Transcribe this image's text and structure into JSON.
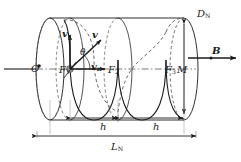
{
  "figure": {
    "background": "#ffffff",
    "line_color": "#1a1a1a",
    "dashed_color": "#4d4d4d",
    "axis_color": "#555555",
    "particle_color": "#8c8c8c"
  },
  "labels": {
    "origin": "O",
    "focus_1": {
      "base": "F",
      "sub": "1"
    },
    "focus_2": {
      "base": "F",
      "sub": "2"
    },
    "focus_3": {
      "base": "F",
      "sub": "3"
    },
    "point_m": "M",
    "diameter": {
      "base": "D",
      "sub": "N"
    },
    "field": "B",
    "velocity_radial": {
      "base": "v",
      "sub": "r"
    },
    "velocity_total": "v",
    "velocity_axial": {
      "base": "v",
      "sub": "z"
    },
    "angle": "θ",
    "pitch_1": "h",
    "pitch_2": "h",
    "length": {
      "base": "L",
      "sub": "N"
    }
  },
  "dimensions": {
    "pitch_segments": 2,
    "pitch_label": "h",
    "total_length_label": "L_N",
    "diameter_label": "D_N"
  },
  "geometry": {
    "canvas_width": 241,
    "canvas_height": 162,
    "cylinder_left_center_x": 50,
    "cylinder_right_center_x": 184,
    "cylinder_axis_y": 69,
    "ellipse_rx": 14,
    "ellipse_ry": 51
  }
}
